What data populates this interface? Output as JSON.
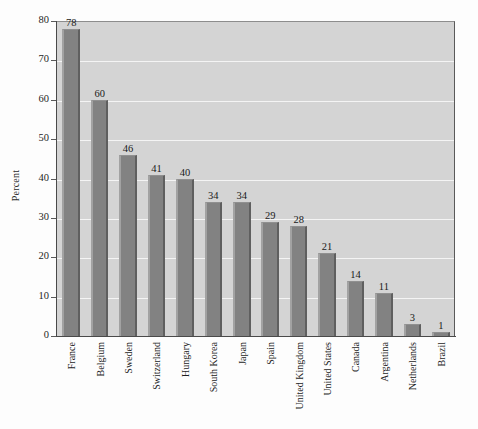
{
  "chart_data": {
    "type": "bar",
    "title": "",
    "xlabel": "",
    "ylabel": "Percent",
    "ylim": [
      0,
      80
    ],
    "ytick_values": [
      0,
      10,
      20,
      30,
      40,
      50,
      60,
      70,
      80
    ],
    "ytick_labels": [
      "0",
      "10",
      "20",
      "30",
      "40",
      "50",
      "60",
      "70",
      "80"
    ],
    "grid": "horizontal",
    "legend": "none",
    "show_value_labels": true,
    "categories": [
      "France",
      "Belgium",
      "Sweden",
      "Switzerland",
      "Hungary",
      "South Korea",
      "Japan",
      "Spain",
      "United Kingdom",
      "United States",
      "Canada",
      "Argentina",
      "Netherlands",
      "Brazil"
    ],
    "values": [
      78,
      60,
      46,
      41,
      40,
      34,
      34,
      29,
      28,
      21,
      14,
      11,
      3,
      1
    ],
    "value_labels": [
      "78",
      "60",
      "46",
      "41",
      "40",
      "34",
      "34",
      "29",
      "28",
      "21",
      "14",
      "11",
      "3",
      "1"
    ],
    "colors": {
      "bar_fill": "#828282",
      "bar_edge_light": "#a2a2a2",
      "bar_edge_dark": "#5f5f5f",
      "plot_background": "#d4d4d4",
      "gridline": "#f4f4f4",
      "axis_line": "#4a4a4a",
      "text": "#1d1d1d",
      "canvas_background": "#fdfdfd"
    }
  }
}
